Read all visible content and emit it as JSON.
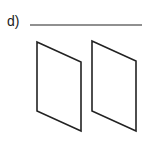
{
  "question": {
    "label": "d)",
    "answer_value": ""
  },
  "figure": {
    "stroke_color": "#222222",
    "answer_line": {
      "x1": 30,
      "y1": 25,
      "x2": 142,
      "y2": 25
    },
    "shapes": [
      {
        "name": "left-plane",
        "points": "37,42 81,62 81,131 37,111"
      },
      {
        "name": "right-plane",
        "points": "92,41 136,61 136,131 92,111"
      }
    ]
  }
}
